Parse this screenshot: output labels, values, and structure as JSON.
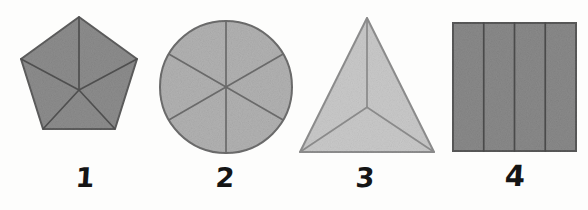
{
  "page": {
    "background_color": "#fdfdfc"
  },
  "figures": [
    {
      "label": "1",
      "shape": "pentagon",
      "parts": 5,
      "division": "radial from center to each vertex",
      "fill_color": "#8d8d8d",
      "stroke_color": "#5e5e5e",
      "divider_color": "#4f4f4f"
    },
    {
      "label": "2",
      "shape": "circle",
      "parts": 6,
      "division": "three diameters through center",
      "fill_color": "#b2b2b2",
      "stroke_color": "#6e6e6e",
      "divider_color": "#6a6a6a"
    },
    {
      "label": "3",
      "shape": "triangle",
      "parts": 3,
      "division": "radial from centroid to each vertex",
      "fill_color": "#c9c9c9",
      "stroke_color": "#8f8f8f",
      "divider_color": "#8a8a8a"
    },
    {
      "label": "4",
      "shape": "square",
      "parts": 4,
      "division": "four equal vertical strips",
      "fill_color": "#8a8a8a",
      "stroke_color": "#5a5a5a",
      "divider_color": "#4a4a4a"
    }
  ]
}
